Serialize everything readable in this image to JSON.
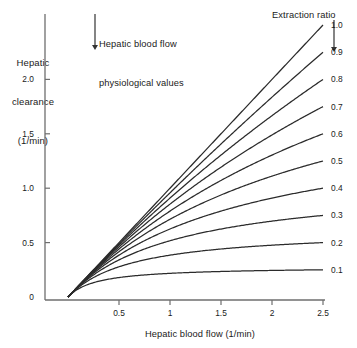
{
  "figure": {
    "y_axis_title": "Hepatic\nclearance\n(1/min)",
    "y_axis_title_lines": [
      "Hepatic",
      "clearance",
      "(1/min)"
    ],
    "x_axis_title": "Hepatic blood flow (1/min)",
    "annotation": "Hepatic blood flow\nphysiological values",
    "annotation_lines": [
      "Hepatic blood flow",
      "physiological values"
    ],
    "annotation_arrow": "down-arrow-icon",
    "series_group_label": "Extraction ratio",
    "series_group_arrow": "down-arrow-icon",
    "line_color": "#2b2b2b",
    "axis_color": "#6e6e6e",
    "text_color": "#1a1a1a",
    "background": "#ffffff"
  },
  "chart_data": {
    "type": "line",
    "title": "",
    "xlabel": "Hepatic blood flow (1/min)",
    "ylabel": "Hepatic clearance (1/min)",
    "xlim": [
      0,
      2.5
    ],
    "ylim": [
      0,
      2.5
    ],
    "xticks": [
      0.5,
      1,
      1.5,
      2,
      2.5
    ],
    "xticklabels": [
      "0.5",
      "1",
      "1.5",
      "2",
      "2.5"
    ],
    "yticks": [
      0,
      0.5,
      1.0,
      1.5,
      2.0
    ],
    "yticklabels": [
      "0",
      "0.5",
      "1.0",
      "1.5",
      "2.0"
    ],
    "grid": false,
    "legend": "right-of-curve-ends",
    "legend_title": "Extraction ratio",
    "annotations": [
      {
        "text": "Hepatic blood flow physiological values",
        "arrow": "down",
        "x": 0.85,
        "y": 2.45
      }
    ],
    "model": "CL = Q * fuCLint / (Q + fuCLint); extraction ratio labels are ER at Q = 2.5 l/min",
    "series": [
      {
        "name": "1.0",
        "extraction_ratio": 1.0,
        "fuCLint": 1000.0,
        "endpoint": {
          "x": 2.5,
          "y": 2.5
        }
      },
      {
        "name": "0.9",
        "extraction_ratio": 0.9,
        "fuCLint": 22.5,
        "endpoint": {
          "x": 2.5,
          "y": 2.25
        }
      },
      {
        "name": "0.8",
        "extraction_ratio": 0.8,
        "fuCLint": 10.0,
        "endpoint": {
          "x": 2.5,
          "y": 2.0
        }
      },
      {
        "name": "0.7",
        "extraction_ratio": 0.7,
        "fuCLint": 5.833,
        "endpoint": {
          "x": 2.5,
          "y": 1.75
        }
      },
      {
        "name": "0.6",
        "extraction_ratio": 0.6,
        "fuCLint": 3.75,
        "endpoint": {
          "x": 2.5,
          "y": 1.5
        }
      },
      {
        "name": "0.5",
        "extraction_ratio": 0.5,
        "fuCLint": 2.5,
        "endpoint": {
          "x": 2.5,
          "y": 1.25
        }
      },
      {
        "name": "0.4",
        "extraction_ratio": 0.4,
        "fuCLint": 1.667,
        "endpoint": {
          "x": 2.5,
          "y": 1.0
        }
      },
      {
        "name": "0.3",
        "extraction_ratio": 0.3,
        "fuCLint": 1.071,
        "endpoint": {
          "x": 2.5,
          "y": 0.75
        }
      },
      {
        "name": "0.2",
        "extraction_ratio": 0.2,
        "fuCLint": 0.625,
        "endpoint": {
          "x": 2.5,
          "y": 0.5
        }
      },
      {
        "name": "0.1",
        "extraction_ratio": 0.1,
        "fuCLint": 0.278,
        "endpoint": {
          "x": 2.5,
          "y": 0.25
        }
      }
    ]
  }
}
